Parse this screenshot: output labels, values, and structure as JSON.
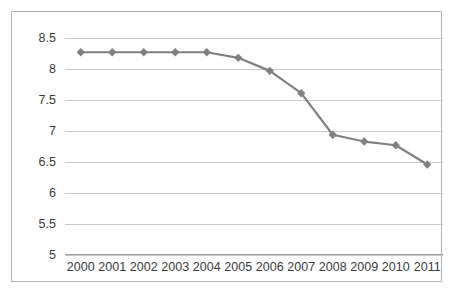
{
  "chart_data": {
    "type": "line",
    "title": "",
    "subtitle": "",
    "xlabel": "",
    "ylabel": "",
    "categories": [
      "2000",
      "2001",
      "2002",
      "2003",
      "2004",
      "2005",
      "2006",
      "2007",
      "2008",
      "2009",
      "2010",
      "2011"
    ],
    "series": [
      {
        "name": "",
        "values": [
          8.27,
          8.27,
          8.27,
          8.27,
          8.27,
          8.18,
          7.97,
          7.61,
          6.94,
          6.83,
          6.77,
          6.46
        ],
        "color": "#808080",
        "marker": "diamond"
      }
    ],
    "ylim": [
      5,
      8.5
    ],
    "ytick_labels": [
      "8.5",
      "8",
      "7.5",
      "7",
      "6.5",
      "6",
      "5.5",
      "5"
    ],
    "ytick_values": [
      8.5,
      8,
      7.5,
      7,
      6.5,
      6,
      5.5,
      5
    ],
    "grid": true,
    "grid_orientation": "horizontal",
    "legend": false,
    "legend_position": "none",
    "plot_background": "#ffffff",
    "grid_color": "#c8c8c8",
    "border_color": "#b4b4b4",
    "text_color": "#3a3a3a"
  }
}
